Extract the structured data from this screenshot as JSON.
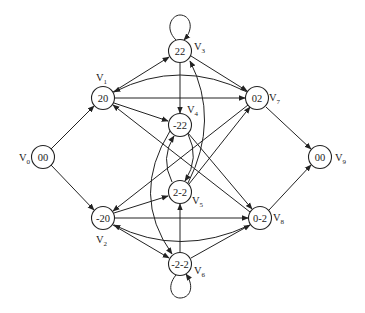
{
  "diagram": {
    "type": "directed-graph",
    "colors": {
      "stroke": "#222222",
      "background": "#ffffff"
    },
    "nodes": [
      {
        "id": "V0",
        "label": "V",
        "sub": "0",
        "value": "00",
        "x": 43,
        "y": 157
      },
      {
        "id": "V1",
        "label": "V",
        "sub": "1",
        "value": "20",
        "x": 103,
        "y": 98
      },
      {
        "id": "V2",
        "label": "V",
        "sub": "2",
        "value": "-20",
        "x": 103,
        "y": 218
      },
      {
        "id": "V3",
        "label": "V",
        "sub": "3",
        "value": "22",
        "x": 180,
        "y": 51
      },
      {
        "id": "V4",
        "label": "V",
        "sub": "4",
        "value": "-22",
        "x": 180,
        "y": 125
      },
      {
        "id": "V5",
        "label": "V",
        "sub": "5",
        "value": "2-2",
        "x": 180,
        "y": 192
      },
      {
        "id": "V6",
        "label": "V",
        "sub": "6",
        "value": "-2-2",
        "x": 180,
        "y": 264
      },
      {
        "id": "V7",
        "label": "V",
        "sub": "7",
        "value": "02",
        "x": 257,
        "y": 98
      },
      {
        "id": "V8",
        "label": "V",
        "sub": "8",
        "value": "0-2",
        "x": 260,
        "y": 218
      },
      {
        "id": "V9",
        "label": "V",
        "sub": "9",
        "value": "00",
        "x": 320,
        "y": 157
      }
    ],
    "edges": [
      {
        "from": "V0",
        "to": "V1"
      },
      {
        "from": "V0",
        "to": "V2"
      },
      {
        "from": "V1",
        "to": "V3"
      },
      {
        "from": "V1",
        "to": "V7"
      },
      {
        "from": "V1",
        "to": "V4"
      },
      {
        "from": "V7",
        "to": "V1",
        "curved": true
      },
      {
        "from": "V3",
        "to": "V3",
        "self_loop": true
      },
      {
        "from": "V3",
        "to": "V4"
      },
      {
        "from": "V3",
        "to": "V7"
      },
      {
        "from": "V5",
        "to": "V3",
        "curved": true
      },
      {
        "from": "V4",
        "to": "V5",
        "curved": true
      },
      {
        "from": "V5",
        "to": "V4",
        "curved": true
      },
      {
        "from": "V4",
        "to": "V8"
      },
      {
        "from": "V8",
        "to": "V1"
      },
      {
        "from": "V5",
        "to": "V7"
      },
      {
        "from": "V7",
        "to": "V2"
      },
      {
        "from": "V7",
        "to": "V9"
      },
      {
        "from": "V2",
        "to": "V5"
      },
      {
        "from": "V2",
        "to": "V8"
      },
      {
        "from": "V2",
        "to": "V6"
      },
      {
        "from": "V8",
        "to": "V2",
        "curved": true
      },
      {
        "from": "V4",
        "to": "V6",
        "curved": true
      },
      {
        "from": "V6",
        "to": "V5"
      },
      {
        "from": "V6",
        "to": "V8"
      },
      {
        "from": "V6",
        "to": "V6",
        "self_loop": true
      },
      {
        "from": "V8",
        "to": "V9"
      }
    ]
  }
}
